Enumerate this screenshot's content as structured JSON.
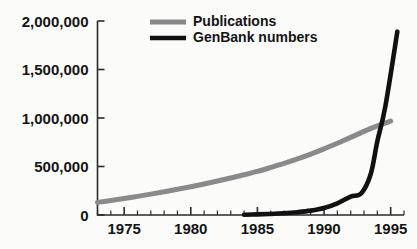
{
  "chart_data": {
    "type": "line",
    "title": "",
    "subtitle": "",
    "xlabel": "",
    "ylabel": "",
    "xlim": [
      1973,
      1996
    ],
    "ylim": [
      0,
      2000000
    ],
    "grid": false,
    "legend_position": "top-center",
    "y_ticks": [
      0,
      500000,
      1000000,
      1500000,
      2000000
    ],
    "y_tick_labels": [
      "0",
      "500,000",
      "1,000,000",
      "1,500,000",
      "2,000,000"
    ],
    "x_ticks": [
      1975,
      1980,
      1985,
      1990,
      1995
    ],
    "x_tick_labels": [
      "1975",
      "1980",
      "1985",
      "1990",
      "1995"
    ],
    "x_minor_tick_interval": 1,
    "series": [
      {
        "name": "Publications",
        "color": "#8a8a8a",
        "x": [
          1973,
          1974,
          1975,
          1976,
          1977,
          1978,
          1979,
          1980,
          1981,
          1982,
          1983,
          1984,
          1985,
          1986,
          1987,
          1988,
          1989,
          1990,
          1991,
          1992,
          1993,
          1994,
          1995
        ],
        "values": [
          130000,
          150000,
          170000,
          192000,
          215000,
          240000,
          265000,
          292000,
          320000,
          350000,
          382000,
          415000,
          450000,
          490000,
          532000,
          578000,
          628000,
          682000,
          740000,
          800000,
          862000,
          918000,
          968000
        ]
      },
      {
        "name": "GenBank numbers",
        "color": "#111111",
        "x": [
          1984,
          1985,
          1986,
          1987,
          1988,
          1989,
          1990,
          1991,
          1992,
          1992.8,
          1993.5,
          1994,
          1994.6,
          1995.5
        ],
        "values": [
          3000,
          6000,
          11000,
          18000,
          29000,
          45000,
          72000,
          120000,
          190000,
          225000,
          420000,
          760000,
          1120000,
          1890000
        ]
      }
    ],
    "annotations": [
      {
        "text": "Publications and GenBank curves cross near 1994 at about 850,000"
      }
    ]
  },
  "legend": {
    "entries": [
      {
        "label": "Publications",
        "color": "#8a8a8a"
      },
      {
        "label": "GenBank numbers",
        "color": "#111111"
      }
    ]
  }
}
